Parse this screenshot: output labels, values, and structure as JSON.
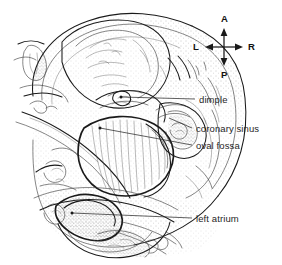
{
  "figure": {
    "kind": "anatomical-line-drawing",
    "background_color": "#ffffff",
    "ink_color": "#1a1a1a",
    "stipple_color": "#7a7a7a"
  },
  "orientation_compass": {
    "name": "orientation-compass",
    "center": {
      "x": 224,
      "y": 47
    },
    "arm_length": 15,
    "directions": [
      {
        "key": "anterior",
        "label": "A",
        "position": "top"
      },
      {
        "key": "left",
        "label": "L",
        "position": "left"
      },
      {
        "key": "right",
        "label": "R",
        "position": "right"
      },
      {
        "key": "posterior",
        "label": "P",
        "position": "bottom"
      }
    ]
  },
  "annotations": [
    {
      "id": "dimple",
      "label": "dimple",
      "text_x": 199,
      "text_y": 95,
      "leader_start": {
        "x": 121,
        "y": 97
      },
      "leader_end": {
        "x": 195,
        "y": 99
      },
      "has_marker_dot": true
    },
    {
      "id": "coronary-sinus",
      "label": "coronary sinus",
      "text_x": 196,
      "text_y": 124,
      "leader_start": {
        "x": 169,
        "y": 118
      },
      "leader_end": {
        "x": 192,
        "y": 128
      },
      "has_marker_dot": false
    },
    {
      "id": "oval-fossa",
      "label": "oval fossa",
      "text_x": 196,
      "text_y": 141,
      "leader_start": {
        "x": 100,
        "y": 128
      },
      "leader_end": {
        "x": 192,
        "y": 145
      },
      "has_marker_dot": true
    },
    {
      "id": "left-atrium",
      "label": "left atrium",
      "text_x": 196,
      "text_y": 214,
      "leader_start": {
        "x": 72,
        "y": 213
      },
      "leader_end": {
        "x": 192,
        "y": 218
      },
      "has_marker_dot": true
    }
  ]
}
